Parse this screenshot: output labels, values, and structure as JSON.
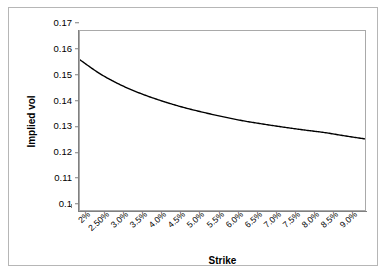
{
  "chart_data": {
    "type": "line",
    "title": "",
    "xlabel": "Strike",
    "ylabel": "Implied vol",
    "grid": false,
    "legend": false,
    "legend_position": "none",
    "line_color": "#000000",
    "plot_border_color": "#a9a9a9",
    "frame_color": "#b6b6b6",
    "background": "#ffffff",
    "ylim": [
      0.1,
      0.17
    ],
    "ytick_labels": [
      "0.17",
      "0.16",
      "0.15",
      "0.14",
      "0.13",
      "0.12",
      "0.11",
      "0.1"
    ],
    "ytick_values": [
      0.17,
      0.16,
      0.15,
      0.14,
      0.13,
      0.12,
      0.11,
      0.1
    ],
    "categories": [
      "2%",
      "2.50%",
      "3.0%",
      "3.5%",
      "4.0%",
      "4.5%",
      "5.0%",
      "5.5%",
      "6.0%",
      "6.5%",
      "7.0%",
      "7.5%",
      "8.0%",
      "8.5%",
      "9.0%"
    ],
    "x": [
      2.0,
      2.5,
      3.0,
      3.5,
      4.0,
      4.5,
      5.0,
      5.5,
      6.0,
      6.5,
      7.0,
      7.5,
      8.0,
      8.5,
      9.0
    ],
    "values": [
      0.1587,
      0.1532,
      0.1489,
      0.1455,
      0.1427,
      0.1403,
      0.1383,
      0.1365,
      0.1349,
      0.1336,
      0.1324,
      0.1313,
      0.1303,
      0.129,
      0.1278
    ],
    "series": [
      {
        "name": "Implied vol",
        "values": [
          0.1587,
          0.1532,
          0.1489,
          0.1455,
          0.1427,
          0.1403,
          0.1383,
          0.1365,
          0.1349,
          0.1336,
          0.1324,
          0.1313,
          0.1303,
          0.129,
          0.1278
        ]
      }
    ]
  }
}
